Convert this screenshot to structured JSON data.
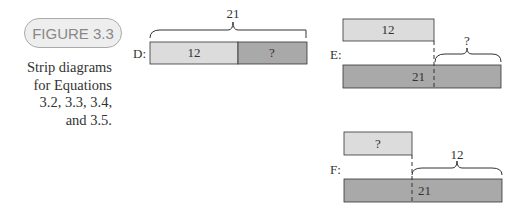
{
  "figure": {
    "label": "FIGURE 3.3",
    "caption_lines": [
      "Strip diagrams",
      "for Equations",
      "3.2, 3.3, 3.4,",
      "and 3.5."
    ]
  },
  "diagrams": {
    "D": {
      "label": "D:",
      "total": "21",
      "part1": "12",
      "part2": "?"
    },
    "E": {
      "label": "E:",
      "top": "12",
      "bottom": "21",
      "brace": "?"
    },
    "F": {
      "label": "F:",
      "top": "?",
      "bottom": "21",
      "brace": "12"
    }
  },
  "colors": {
    "light": "#dcdcdc",
    "dark": "#a9a9a9",
    "border": "#333333"
  }
}
